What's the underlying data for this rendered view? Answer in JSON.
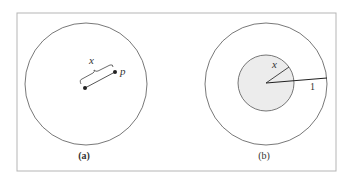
{
  "figure": {
    "frame_color": "#b5b5b5",
    "line_color": "#555555",
    "shade_color": "#ececec",
    "panels": [
      {
        "id": "a",
        "caption": "(a)",
        "variable_label": "x",
        "point_label": "p",
        "description": "Circle with a center point and a point p at distance x from the center"
      },
      {
        "id": "b",
        "caption": "(b)",
        "variable_label": "x",
        "radius_label": "1",
        "description": "Unit circle with a shaded inner disk of radius x"
      }
    ]
  }
}
